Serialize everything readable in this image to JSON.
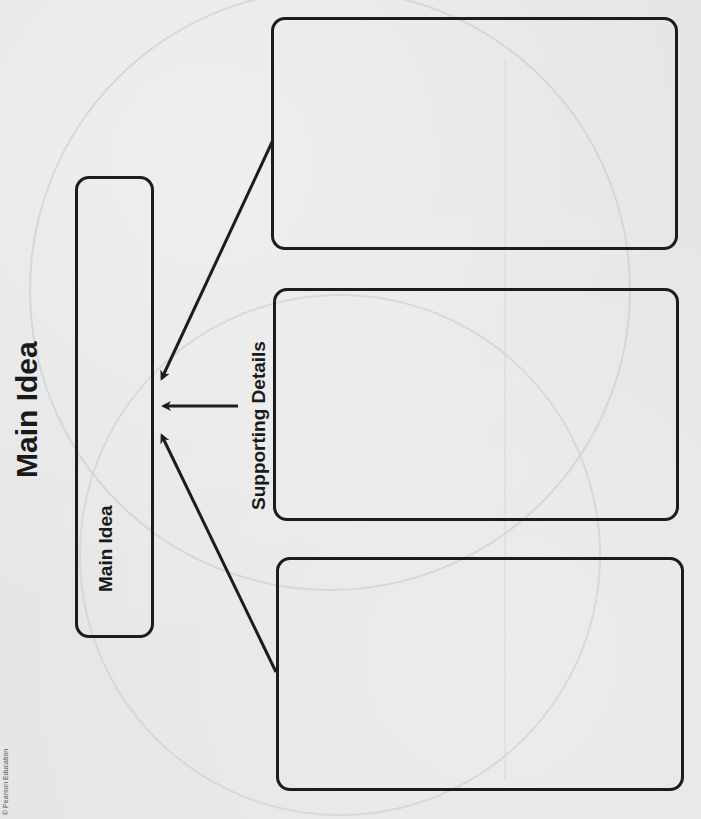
{
  "page": {
    "title": "Main Idea",
    "copyright": "© Pearson Education",
    "orientation": "rotated-90-ccw"
  },
  "organizer": {
    "main_idea_box": {
      "label": "Main Idea",
      "content": ""
    },
    "supporting_label": "Supporting Details",
    "detail_boxes": [
      {
        "position": "top",
        "content": ""
      },
      {
        "position": "middle",
        "content": ""
      },
      {
        "position": "bottom",
        "content": ""
      }
    ]
  },
  "colors": {
    "ink": "#1c1c1c",
    "paper": "#e6e6e6"
  }
}
